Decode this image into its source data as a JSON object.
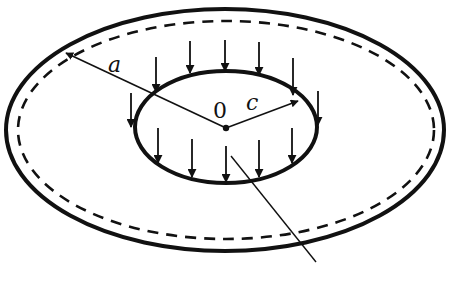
{
  "figure": {
    "colors": {
      "stroke": "#111111",
      "background": "#ffffff"
    },
    "labels": {
      "center": "0",
      "outer_radius": "a",
      "inner_radius": "c"
    },
    "outer_edge": {
      "style": "solid",
      "cx": 225,
      "cy": 130,
      "rx": 219,
      "ry": 121
    },
    "mid_surface": {
      "style": "dashed",
      "cx": 226,
      "cy": 130,
      "rx": 208,
      "ry": 109
    },
    "inner_edge": {
      "style": "solid",
      "cx": 226,
      "cy": 127,
      "rx": 91,
      "ry": 56
    },
    "load_arrow_count": 14
  }
}
